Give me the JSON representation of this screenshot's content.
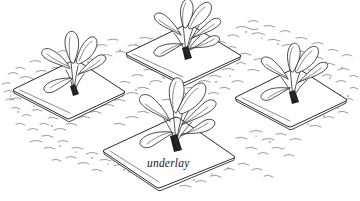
{
  "figure": {
    "caption_label": "underlay",
    "colors": {
      "ink": "#2b2b2b",
      "soil": "#4a4a4a",
      "paper": "#ffffff"
    },
    "mats": [
      {
        "id": "mat-left",
        "label": "",
        "position": "left",
        "plant": "seedling-left"
      },
      {
        "id": "mat-top-center",
        "label": "",
        "position": "top-center",
        "plant": "seedling-top-center"
      },
      {
        "id": "mat-right",
        "label": "",
        "position": "right",
        "plant": "seedling-right"
      },
      {
        "id": "mat-front",
        "label": "underlay",
        "position": "front-center",
        "plant": "seedling-front"
      }
    ],
    "plants": [
      {
        "id": "seedling-left",
        "leaf_count": 5
      },
      {
        "id": "seedling-top-center",
        "leaf_count": 6
      },
      {
        "id": "seedling-right",
        "leaf_count": 5
      },
      {
        "id": "seedling-front",
        "leaf_count": 6
      }
    ]
  }
}
